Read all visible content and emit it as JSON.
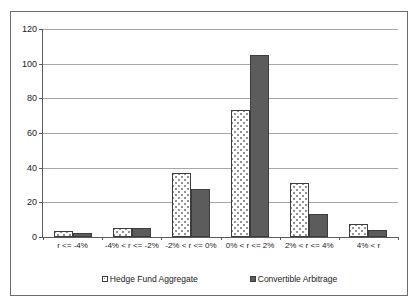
{
  "chart_data": {
    "type": "bar",
    "title": "",
    "subtitle": "",
    "xlabel": "",
    "ylabel": "",
    "ylim": [
      0,
      120
    ],
    "yticks": [
      0,
      20,
      40,
      60,
      80,
      100,
      120
    ],
    "grid": true,
    "legend_position": "bottom",
    "categories": [
      "r <= -4%",
      "-4% < r <= -2%",
      "-2% < r <= 0%",
      "0% < r <= 2%",
      "2% < r <= 4%",
      "4% < r"
    ],
    "series": [
      {
        "name": "Hedge Fund Aggregate",
        "color": "#ffffff",
        "pattern": "dotted",
        "values": [
          3.5,
          5,
          37,
          73,
          31,
          7.5
        ]
      },
      {
        "name": "Convertible Arbitrage",
        "color": "#5c5c5c",
        "pattern": "solid",
        "values": [
          2.5,
          5.3,
          27.5,
          105,
          13,
          4
        ]
      }
    ]
  },
  "axis": {
    "y_tick_labels": [
      "0",
      "20",
      "40",
      "60",
      "80",
      "100",
      "120"
    ]
  },
  "legend": {
    "items": [
      {
        "label": "Hedge Fund Aggregate"
      },
      {
        "label": "Convertible Arbitrage"
      }
    ]
  },
  "colors": {
    "frame": "#6b6b6b",
    "axis": "#5a5a5a",
    "gridline": "#a6a6a6",
    "bar_outline": "#3d3d3d",
    "series_a_fill": "#ffffff",
    "series_b_fill": "#5c5c5c",
    "text": "#1a1a1a",
    "background": "#ffffff"
  }
}
